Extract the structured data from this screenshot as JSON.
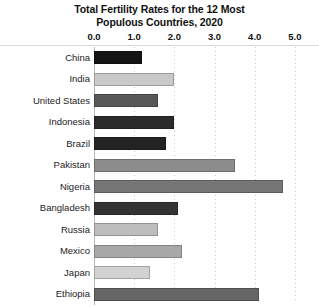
{
  "chart_data": {
    "type": "bar",
    "orientation": "horizontal",
    "title": "Total Fertility Rates for the 12 Most Populous Countries, 2020",
    "title_lines": [
      "Total Fertility Rates for the 12 Most",
      "Populous Countries, 2020"
    ],
    "xlabel": "",
    "ylabel": "",
    "xlim": [
      0.0,
      5.6
    ],
    "xticks": [
      0.0,
      1.0,
      2.0,
      3.0,
      4.0,
      5.0
    ],
    "xtick_labels": [
      "0.0",
      "1.0",
      "2.0",
      "3.0",
      "4.0",
      "5.0"
    ],
    "grid": "vertical-dotted",
    "legend": "none",
    "categories": [
      "China",
      "India",
      "United States",
      "Indonesia",
      "Brazil",
      "Pakistan",
      "Nigeria",
      "Bangladesh",
      "Russia",
      "Mexico",
      "Japan",
      "Ethiopia"
    ],
    "values": [
      1.2,
      2.0,
      1.6,
      2.0,
      1.8,
      3.5,
      4.7,
      2.1,
      1.6,
      2.2,
      1.4,
      4.1
    ],
    "bar_colors": [
      "#141414",
      "#c9c9c9",
      "#585858",
      "#2b2b2b",
      "#232323",
      "#8c8c8c",
      "#767676",
      "#333333",
      "#bdbdbd",
      "#a8a8a8",
      "#d2d2d2",
      "#666666"
    ],
    "bars": [
      {
        "label": "China",
        "value": 1.2,
        "color": "#141414"
      },
      {
        "label": "India",
        "value": 2.0,
        "color": "#c9c9c9"
      },
      {
        "label": "United States",
        "value": 1.6,
        "color": "#585858"
      },
      {
        "label": "Indonesia",
        "value": 2.0,
        "color": "#2b2b2b"
      },
      {
        "label": "Brazil",
        "value": 1.8,
        "color": "#232323"
      },
      {
        "label": "Pakistan",
        "value": 3.5,
        "color": "#8c8c8c"
      },
      {
        "label": "Nigeria",
        "value": 4.7,
        "color": "#767676"
      },
      {
        "label": "Bangladesh",
        "value": 2.1,
        "color": "#333333"
      },
      {
        "label": "Russia",
        "value": 1.6,
        "color": "#bdbdbd"
      },
      {
        "label": "Mexico",
        "value": 2.2,
        "color": "#a8a8a8"
      },
      {
        "label": "Japan",
        "value": 1.4,
        "color": "#d2d2d2"
      },
      {
        "label": "Ethiopia",
        "value": 4.1,
        "color": "#666666"
      }
    ]
  },
  "colors": {
    "background": "#ffffff",
    "axis_line": "#b8b8b8",
    "gridline": "#c9c9c9",
    "rule": "#d8d8d8",
    "text": "#111111"
  }
}
